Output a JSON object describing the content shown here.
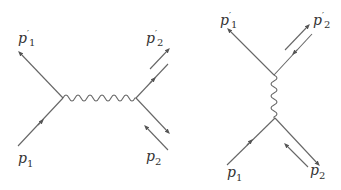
{
  "diagram": {
    "type": "feynman-diagrams",
    "line_color": "#666666",
    "left": {
      "channel": "s-channel",
      "labels": {
        "p1": "p",
        "p1_sub": "1",
        "p1p": "p",
        "p1p_sup": "′",
        "p1p_sub": "1",
        "p2": "p",
        "p2_sub": "2",
        "p2p": "p",
        "p2p_sup": "′",
        "p2p_sub": "2"
      }
    },
    "right": {
      "channel": "t-channel",
      "labels": {
        "p1": "p",
        "p1_sub": "1",
        "p1p": "p",
        "p1p_sup": "′",
        "p1p_sub": "1",
        "p2": "p",
        "p2_sub": "2",
        "p2p": "p",
        "p2p_sup": "′",
        "p2p_sub": "2"
      }
    }
  }
}
